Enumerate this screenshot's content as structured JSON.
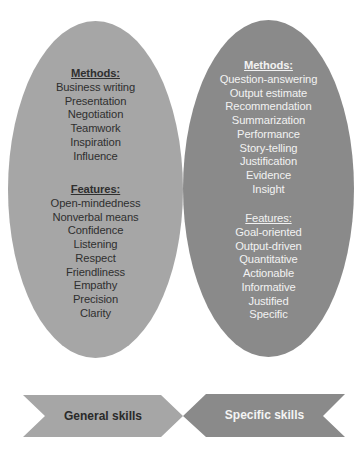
{
  "colors": {
    "general_fill": "#a6a6a6",
    "specific_fill": "#8a8a8a",
    "general_text": "#2f2f2f",
    "specific_text": "#f2f2f2"
  },
  "general": {
    "label": "General skills",
    "methods_header": "Methods:",
    "methods": [
      "Business writing",
      "Presentation",
      "Negotiation",
      "Teamwork",
      "Inspiration",
      "Influence"
    ],
    "features_header": "Features:",
    "features": [
      "Open-mindedness",
      "Nonverbal means",
      "Confidence",
      "Listening",
      "Respect",
      "Friendliness",
      "Empathy",
      "Precision",
      "Clarity"
    ]
  },
  "specific": {
    "label": "Specific skills",
    "methods_header": "Methods:",
    "methods": [
      "Question-answering",
      "Output estimate",
      "Recommendation",
      "Summarization",
      "Performance",
      "Story-telling",
      "Justification",
      "Evidence",
      "Insight"
    ],
    "features_header": "Features:",
    "features": [
      "Goal-oriented",
      "Output-driven",
      "Quantitative",
      "Actionable",
      "Informative",
      "Justified",
      "Specific"
    ]
  }
}
